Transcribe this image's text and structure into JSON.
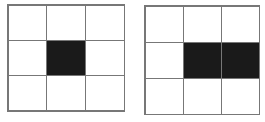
{
  "diagrams": [
    {
      "name": "left-grid",
      "rows": 3,
      "cols": 3,
      "filled": [
        [
          0,
          0,
          0
        ],
        [
          0,
          1,
          0
        ],
        [
          0,
          0,
          0
        ]
      ],
      "fill_color": "#1a1a1a",
      "line_color": "#777777"
    },
    {
      "name": "right-grid",
      "rows": 3,
      "cols": 3,
      "filled": [
        [
          0,
          0,
          0
        ],
        [
          0,
          1,
          1
        ],
        [
          0,
          0,
          0
        ]
      ],
      "fill_color": "#1a1a1a",
      "line_color": "#777777"
    }
  ]
}
